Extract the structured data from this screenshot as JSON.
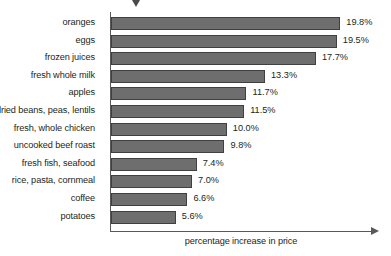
{
  "chart_data": {
    "type": "bar",
    "orientation": "horizontal",
    "title": "",
    "xlabel": "percentage increase in price",
    "ylabel": "",
    "categories": [
      "oranges",
      "eggs",
      "frozen juices",
      "fresh whole milk",
      "apples",
      "dried beans, peas, lentils",
      "fresh, whole chicken",
      "uncooked beef roast",
      "fresh fish, seafood",
      "rice, pasta, cornmeal",
      "coffee",
      "potatoes"
    ],
    "values": [
      19.8,
      19.5,
      17.7,
      13.3,
      11.7,
      11.5,
      10.0,
      9.8,
      7.4,
      7.0,
      6.6,
      5.6
    ],
    "value_labels": [
      "19.8%",
      "19.5%",
      "17.7%",
      "13.3%",
      "11.7%",
      "11.5%",
      "10.0%",
      "9.8%",
      "7.4%",
      "7.0%",
      "6.6%",
      "5.6%"
    ],
    "xlim": [
      0,
      22.6
    ],
    "grid": false,
    "legend": null,
    "bar_color": "#6e6e6e",
    "bar_border_color": "#404040",
    "axis_color": "#58595b",
    "text_color": "#231f20",
    "annotations": [
      {
        "name": "top-marker",
        "shape": "down-triangle",
        "color": "#4a4a4a"
      }
    ]
  }
}
